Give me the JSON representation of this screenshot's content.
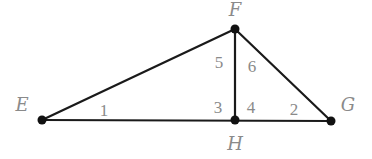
{
  "diagram": {
    "points": [
      {
        "name": "E",
        "x": 42,
        "y": 120,
        "label_x": 22,
        "label_y": 111
      },
      {
        "name": "F",
        "x": 235,
        "y": 29,
        "label_x": 235,
        "label_y": 16
      },
      {
        "name": "G",
        "x": 331,
        "y": 121,
        "label_x": 348,
        "label_y": 111
      },
      {
        "name": "H",
        "x": 235,
        "y": 120,
        "label_x": 235,
        "label_y": 150
      }
    ],
    "segments": [
      {
        "from": "E",
        "to": "F"
      },
      {
        "from": "E",
        "to": "G"
      },
      {
        "from": "F",
        "to": "G"
      },
      {
        "from": "F",
        "to": "H"
      }
    ],
    "angles": [
      {
        "label": "1",
        "x": 104,
        "y": 116
      },
      {
        "label": "2",
        "x": 294,
        "y": 115
      },
      {
        "label": "3",
        "x": 218,
        "y": 113
      },
      {
        "label": "4",
        "x": 251,
        "y": 113
      },
      {
        "label": "5",
        "x": 219,
        "y": 68
      },
      {
        "label": "6",
        "x": 252,
        "y": 72
      }
    ],
    "colors": {
      "line": "#1a1a1a",
      "label": "#8a8a8a"
    }
  }
}
